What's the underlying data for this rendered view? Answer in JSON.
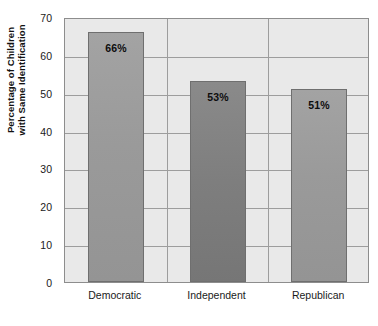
{
  "chart_data": {
    "type": "bar",
    "title": "",
    "subtitle": "",
    "xlabel": "",
    "ylabel_lines": [
      "Percentage of Children",
      "with Same Identification"
    ],
    "ylabel": "Percentage of Children with Same Identification",
    "categories": [
      "Democratic",
      "Independent",
      "Republican"
    ],
    "values": [
      66,
      53,
      51
    ],
    "data_labels": [
      "66%",
      "53%",
      "51%"
    ],
    "ylim": [
      0,
      70
    ],
    "yticks": [
      0,
      10,
      20,
      30,
      40,
      50,
      60,
      70
    ],
    "ytick_labels": [
      "0",
      "10",
      "20",
      "30",
      "40",
      "50",
      "60",
      "70"
    ],
    "grid": "horizontal-and-vertical",
    "legend": "none",
    "bar_colors": [
      "#9a9a9a",
      "#7e7e7e",
      "#9a9a9a"
    ],
    "plot_background": "#e9e9e9",
    "grid_color": "#9d9d9d",
    "axis_color": "#8d8d8d",
    "text_color": "#1a1a1a"
  }
}
